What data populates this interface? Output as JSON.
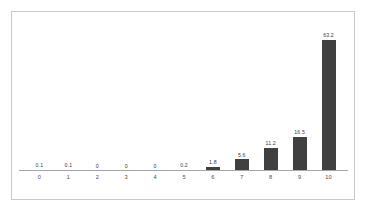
{
  "figure": {
    "background_color": "#ffffff",
    "frame_border_color": "#c9c9c9",
    "axis_line_color": "#a6a6a6",
    "caption_fragment": ""
  },
  "chart_data": {
    "type": "bar",
    "title": "",
    "subtitle": "",
    "xlabel": "",
    "ylabel": "",
    "categories": [
      "0",
      "1",
      "2",
      "3",
      "4",
      "5",
      "6",
      "7",
      "8",
      "9",
      "10"
    ],
    "values": [
      0.1,
      0.1,
      0,
      0,
      0,
      0.2,
      1.8,
      5.6,
      11.2,
      16.5,
      63.2
    ],
    "data_labels": [
      "0.1",
      "0.1",
      "0",
      "0",
      "0",
      "0.2",
      "1.8",
      "5.6",
      "11.2",
      "16.5",
      "63.2"
    ],
    "ylim": [
      0,
      70
    ],
    "grid": false,
    "legend": null,
    "series": [
      {
        "name": "",
        "color": "#404040",
        "values": [
          0.1,
          0.1,
          0,
          0,
          0,
          0.2,
          1.8,
          5.6,
          11.2,
          16.5,
          63.2
        ]
      }
    ],
    "annotations": []
  }
}
